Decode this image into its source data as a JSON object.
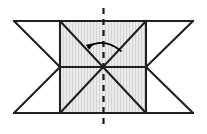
{
  "figure": {
    "canvas": {
      "width": 207,
      "height": 134,
      "background": "#ffffff"
    },
    "colors": {
      "stroke": "#231f20",
      "hatch_fill": "#e8e8e8",
      "hatch_line": "#c9c9c9",
      "arrow": "#000000",
      "axis_dash": "#1a1a1a"
    },
    "strokes": {
      "outline_width": 2.1,
      "diagonal_width": 2.1,
      "arc_width": 1.6,
      "dash_width": 2.2,
      "dash_pattern": "6,5"
    },
    "geometry": {
      "center": {
        "x": 103,
        "y": 67,
        "label": "center-of-rotation"
      },
      "inner_rect": {
        "left": 60,
        "top": 21,
        "right": 146,
        "bottom": 113
      },
      "outer_bounds": {
        "left": 14,
        "top": 21,
        "right": 193,
        "bottom": 113
      },
      "mid_y": 67,
      "axis_x": 103.5,
      "axis_top": 8,
      "axis_bottom": 126
    },
    "elements": {
      "hatched_region": "hatched-rectangle",
      "left_triangle_upper": "left-upper-triangle",
      "left_triangle_lower": "left-lower-triangle",
      "right_triangle_upper": "right-upper-triangle",
      "right_triangle_lower": "right-lower-triangle",
      "diagonal_tl_br": "diagonal-top-left-to-bottom-right",
      "diagonal_bl_tr": "diagonal-bottom-left-to-top-right",
      "horizontal_mid": "horizontal-midline",
      "top_edge": "top-edge",
      "bottom_edge": "bottom-edge",
      "axis": "dashed-vertical-symmetry-axis",
      "rotation_arrow": "curved-rotation-arrow"
    },
    "arrow": {
      "start": {
        "x": 121,
        "y": 51
      },
      "end": {
        "x": 88,
        "y": 47
      },
      "control": {
        "x": 104,
        "y": 38
      },
      "head_tip": {
        "x": 83,
        "y": 50
      },
      "direction": "counterclockwise-left"
    }
  }
}
